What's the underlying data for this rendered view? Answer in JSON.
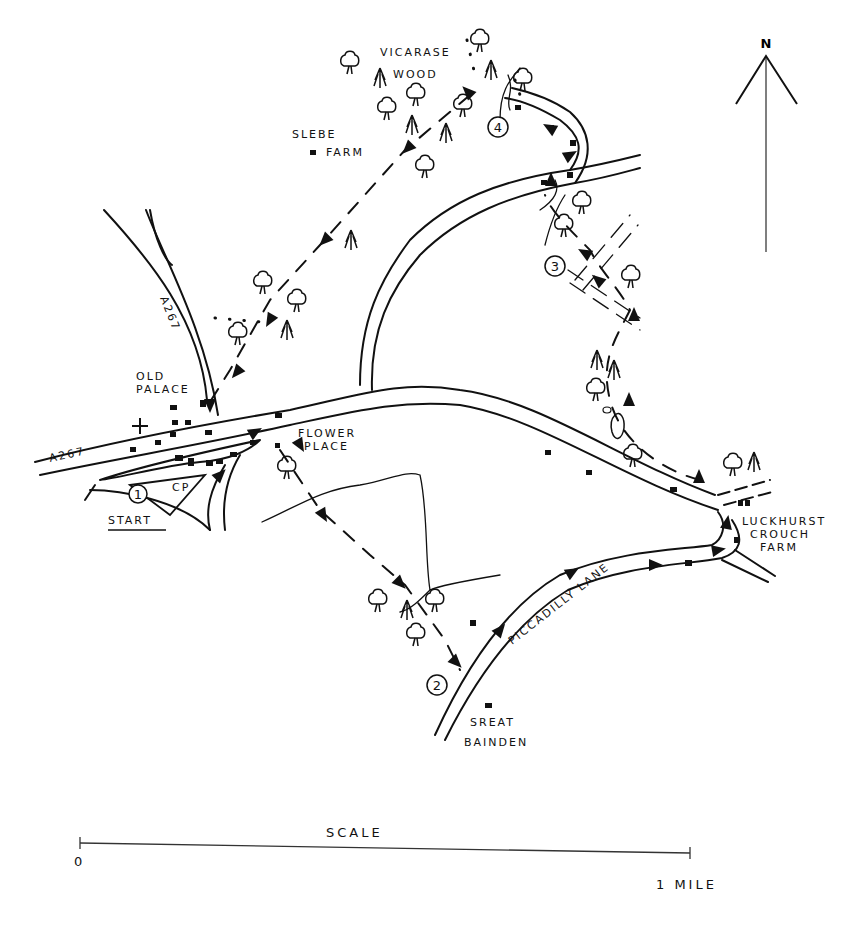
{
  "map": {
    "north_label": "N",
    "places": {
      "vicarage_wood_line1": "VICARASE",
      "vicarage_wood_line2": "WOOD",
      "glebe_farm_line1": "SLEBE",
      "glebe_farm_line2": "FARM",
      "old_palace_line1": "OLD",
      "old_palace_line2": "PALACE",
      "flower_place_line1": "FLOWER",
      "flower_place_line2": "PLACE",
      "luckhurst_line1": "LUCKHURST",
      "luckhurst_line2": "CROUCH",
      "luckhurst_line3": "FARM",
      "great_bainden_line1": "SREAT",
      "great_bainden_line2": "BAINDEN",
      "car_park": "CP",
      "start": "START"
    },
    "roads": {
      "a267_west": "A267",
      "a267_north": "A267",
      "piccadilly_lane": "PICCADILLY LANE"
    },
    "waypoints": [
      "1",
      "2",
      "3",
      "4"
    ],
    "scale": {
      "title": "SCALE",
      "start_label": "0",
      "end_label": "1 MILE"
    }
  }
}
